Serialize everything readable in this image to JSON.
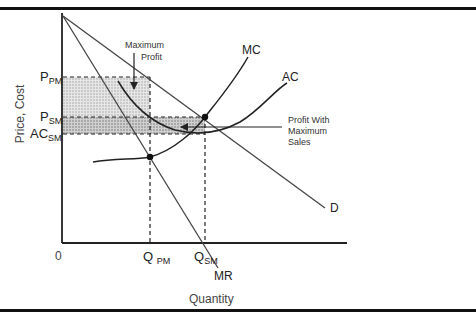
{
  "diagram": {
    "y_axis_label": "Price, Cost",
    "x_axis_label": "Quantity",
    "origin_label": "0",
    "price_labels": [
      {
        "main": "P",
        "sub": "PM"
      },
      {
        "main": "P",
        "sub": "SM"
      },
      {
        "main": "AC",
        "sub": "SM"
      }
    ],
    "quantity_labels": [
      {
        "main": "Q",
        "sub": "PM"
      },
      {
        "main": "Q",
        "sub": "SM"
      }
    ],
    "curves": {
      "mc": "MC",
      "ac": "AC",
      "demand": "D",
      "marginal_revenue": "MR"
    },
    "annotations": {
      "max_profit_line1": "Maximum",
      "max_profit_line2": "Profit",
      "profit_sales_line1": "Profit With",
      "profit_sales_line2": "Maximum",
      "profit_sales_line3": "Sales"
    },
    "colors": {
      "line": "#222222",
      "shade_light": "#d8d8d8",
      "shade_dark": "#b8b8b8"
    }
  }
}
